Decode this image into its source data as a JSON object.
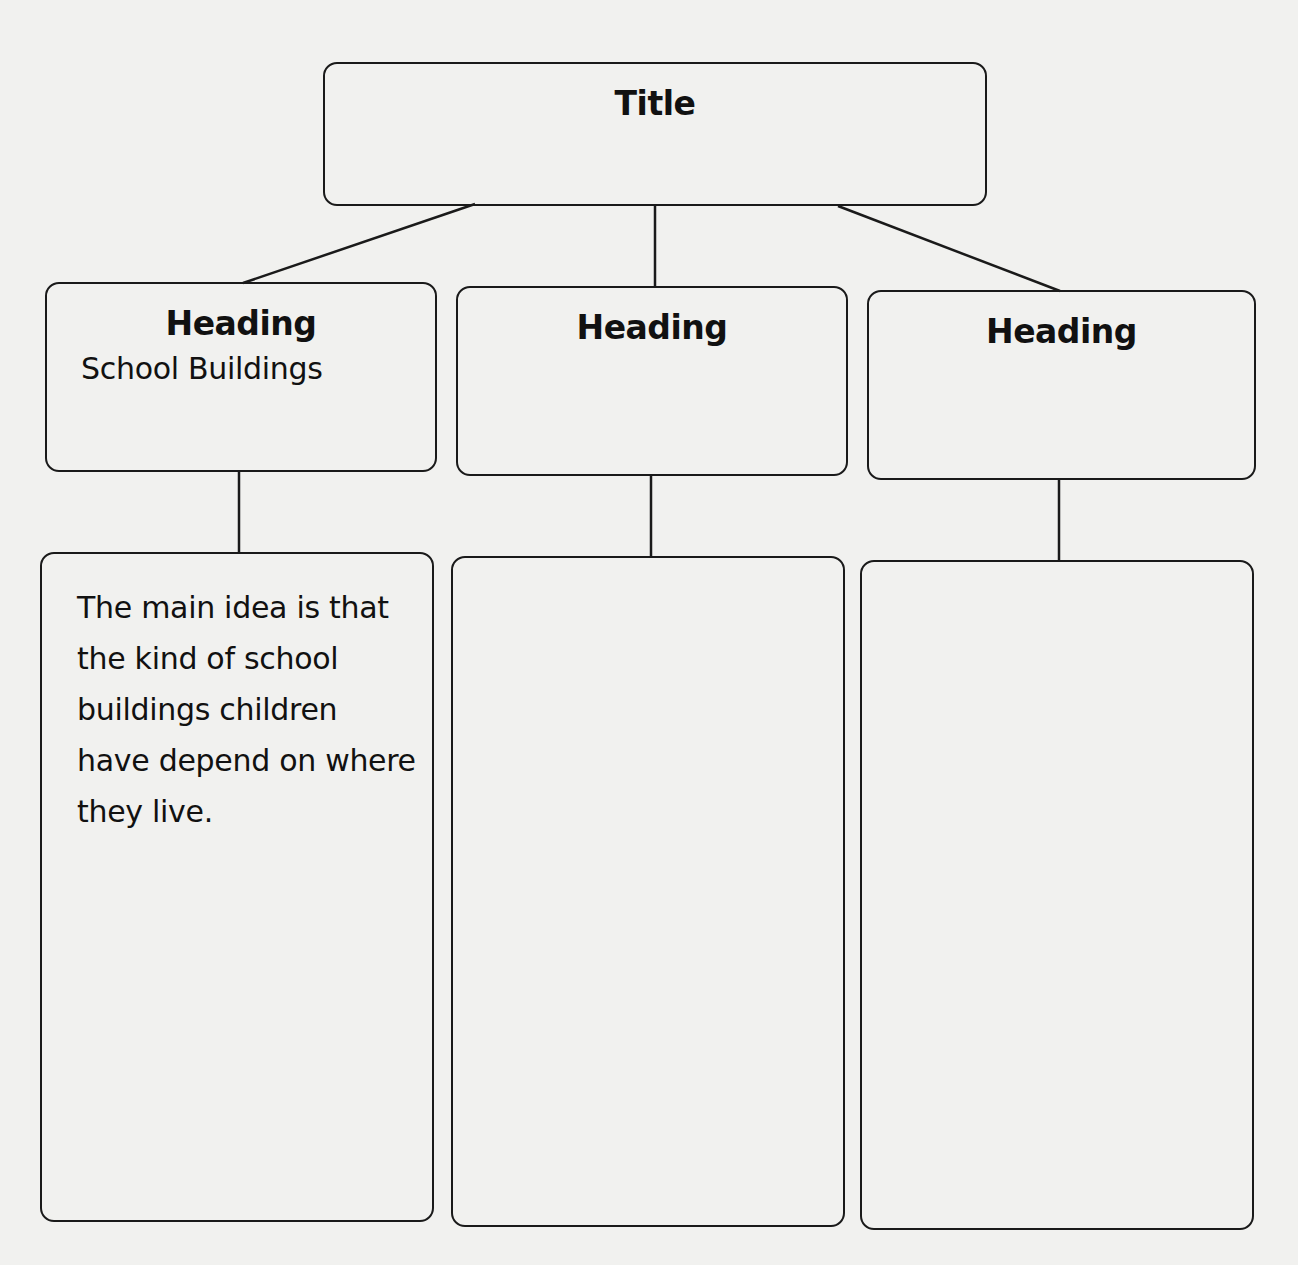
{
  "diagram": {
    "title_box": {
      "label": "Title"
    },
    "columns": [
      {
        "heading": "Heading",
        "subheading": "School Buildings",
        "body": "The main idea is that the kind of school buildings children have depend on where they live."
      },
      {
        "heading": "Heading",
        "subheading": "",
        "body": ""
      },
      {
        "heading": "Heading",
        "subheading": "",
        "body": ""
      }
    ],
    "colors": {
      "background": "#f1f1ef",
      "stroke": "#1a1a1a",
      "text": "#111111"
    }
  }
}
